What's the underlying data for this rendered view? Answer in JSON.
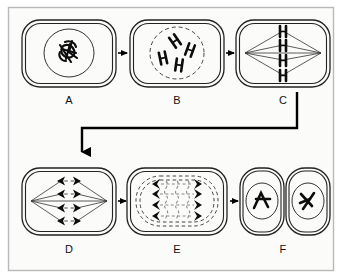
{
  "figure": {
    "type": "biology-process-diagram",
    "canvas": {
      "width": 342,
      "height": 279
    },
    "colors": {
      "background": "#ffffff",
      "panel_background": "#fbfbfa",
      "panel_border": "#b9b9b9",
      "cell_outline": "#222222",
      "chromosome": "#0d0d0d",
      "spindle_fiber": "#333333",
      "dashed_envelope": "#444444",
      "dashed_fiber": "#8a8a8a",
      "flow_arrow": "#000000",
      "label_text": "#111111"
    },
    "panel": {
      "x": 8,
      "y": 7,
      "width": 326,
      "height": 264
    }
  },
  "stages": [
    {
      "id": "A",
      "label": "A",
      "name": "interphase",
      "description": "Cell with intact nuclear envelope containing tangled chromatin",
      "label_x": 69,
      "label_y": 104,
      "cell": {
        "x": 22,
        "y": 20,
        "width": 94,
        "height": 67,
        "radius": 18,
        "shape": "rounded-rect",
        "double_outline": true
      },
      "nucleus": {
        "type": "solid-circle",
        "cx": 69,
        "cy": 53,
        "rx": 25,
        "ry": 24
      },
      "chromosomes": {
        "count": 4,
        "form": "tangled-chromatin"
      }
    },
    {
      "id": "B",
      "label": "B",
      "name": "prophase",
      "description": "Condensed chromosomes inside a dissolving dashed nuclear envelope",
      "label_x": 177,
      "label_y": 104,
      "cell": {
        "x": 130,
        "y": 20,
        "width": 94,
        "height": 67,
        "radius": 18,
        "shape": "rounded-rect",
        "double_outline": true
      },
      "nucleus": {
        "type": "dashed-circle",
        "cx": 177,
        "cy": 53,
        "rx": 27,
        "ry": 26
      },
      "chromosomes": {
        "count": 4,
        "form": "x-shaped-scattered"
      }
    },
    {
      "id": "C",
      "label": "C",
      "name": "metaphase",
      "description": "Chromosomes aligned at the equator between two spindle poles",
      "label_x": 283,
      "label_y": 104,
      "cell": {
        "x": 236,
        "y": 20,
        "width": 94,
        "height": 67,
        "radius": 18,
        "shape": "rounded-rect",
        "double_outline": true
      },
      "nucleus": {
        "type": "none"
      },
      "spindle": {
        "poles": 2,
        "pole_left_x": 244,
        "pole_right_x": 322,
        "pole_y": 53,
        "fiber_count": 8
      },
      "chromosomes": {
        "count": 4,
        "form": "x-shaped-aligned"
      }
    },
    {
      "id": "D",
      "label": "D",
      "name": "anaphase",
      "description": "Sister chromatids pulled apart toward opposite poles",
      "label_x": 69,
      "label_y": 253,
      "cell": {
        "x": 22,
        "y": 168,
        "width": 94,
        "height": 67,
        "radius": 18,
        "shape": "rounded-rect",
        "double_outline": true
      },
      "nucleus": {
        "type": "none"
      },
      "spindle": {
        "poles": 2,
        "pole_left_x": 30,
        "pole_right_x": 108,
        "pole_y": 201,
        "fiber_count": 8
      },
      "chromosomes": {
        "count": 8,
        "form": "arrowhead-pairs",
        "rows": 4
      }
    },
    {
      "id": "E",
      "label": "E",
      "name": "telophase",
      "description": "Elongated cell with two reforming dashed nuclear envelopes",
      "label_x": 177,
      "label_y": 253,
      "cell": {
        "x": 127,
        "y": 168,
        "width": 100,
        "height": 67,
        "radius": 18,
        "shape": "rounded-rect",
        "double_outline": true
      },
      "nucleus": {
        "type": "dashed-double-oval",
        "count": 2
      },
      "chromosomes": {
        "count": 8,
        "form": "chevron-clusters",
        "rows": 4
      }
    },
    {
      "id": "F",
      "label": "F",
      "name": "cytokinesis",
      "description": "Two separated daughter cells each with a new nucleus",
      "label_x": 283,
      "label_y": 253,
      "cell": {
        "x": 240,
        "y": 168,
        "width": 90,
        "height": 67,
        "radius": 20,
        "shape": "two-daughter-cells",
        "double_outline": true
      },
      "daughter_cells": [
        {
          "x": 240,
          "y": 168,
          "width": 44,
          "height": 67,
          "nucleus": {
            "cx": 262,
            "cy": 201,
            "rx": 16,
            "ry": 18
          }
        },
        {
          "x": 286,
          "y": 168,
          "width": 44,
          "height": 67,
          "nucleus": {
            "cx": 308,
            "cy": 201,
            "rx": 16,
            "ry": 18
          }
        }
      ],
      "chromosomes": {
        "count": 4,
        "form": "v-shaped-pairs"
      }
    }
  ],
  "connectors": [
    {
      "id": "a-to-b",
      "from": "A",
      "to": "B",
      "type": "straight-arrow",
      "orientation": "right",
      "x1": 118,
      "x2": 128,
      "y": 53
    },
    {
      "id": "b-to-c",
      "from": "B",
      "to": "C",
      "type": "straight-arrow",
      "orientation": "right",
      "x1": 226,
      "x2": 234,
      "y": 53
    },
    {
      "id": "c-to-d",
      "from": "C",
      "to": "D",
      "type": "elbow-arrow",
      "orientation": "down-left-down",
      "start_x": 297,
      "start_y": 92,
      "mid_y": 128,
      "end_x": 82,
      "end_y": 160
    },
    {
      "id": "d-to-e",
      "from": "D",
      "to": "E",
      "type": "straight-arrow",
      "orientation": "right",
      "x1": 118,
      "x2": 126,
      "y": 201
    },
    {
      "id": "e-to-f",
      "from": "E",
      "to": "F",
      "type": "straight-arrow",
      "orientation": "right",
      "x1": 229,
      "x2": 238,
      "y": 201
    }
  ]
}
